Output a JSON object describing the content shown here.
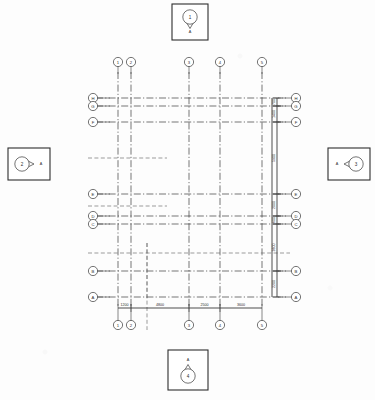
{
  "drawing": {
    "title": "Structural Grid / Column Layout Plan",
    "type": "architectural-grid-plan",
    "line_color": "#3a3a3a",
    "background_color": "#fdfdfd",
    "bubble_fill": "#ffffff"
  },
  "column_grid": {
    "axis_label": "column-grid-lines",
    "lines": [
      {
        "label": "1",
        "x": 118
      },
      {
        "label": "2",
        "x": 131
      },
      {
        "label": "3",
        "x": 189
      },
      {
        "label": "4",
        "x": 220
      },
      {
        "label": "5",
        "x": 262
      }
    ]
  },
  "row_grid": {
    "axis_label": "row-grid-lines",
    "lines": [
      {
        "label": "H",
        "y": 98
      },
      {
        "label": "G",
        "y": 106
      },
      {
        "label": "F",
        "y": 122
      },
      {
        "label": "E",
        "y": 194
      },
      {
        "label": "D",
        "y": 216
      },
      {
        "label": "C",
        "y": 224
      },
      {
        "label": "B",
        "y": 271
      },
      {
        "label": "A",
        "y": 297
      }
    ]
  },
  "dimensions": {
    "horizontal": [
      {
        "value": "1200",
        "from": 118,
        "to": 131
      },
      {
        "value": "4800",
        "from": 131,
        "to": 189
      },
      {
        "value": "2500",
        "from": 189,
        "to": 220
      },
      {
        "value": "3600",
        "from": 220,
        "to": 262
      }
    ],
    "vertical": [
      {
        "value": "700",
        "from": 98,
        "to": 106
      },
      {
        "value": "1400",
        "from": 106,
        "to": 122
      },
      {
        "value": "5900",
        "from": 122,
        "to": 194
      },
      {
        "value": "2000",
        "from": 194,
        "to": 216
      },
      {
        "value": "600",
        "from": 216,
        "to": 224
      },
      {
        "value": "3600",
        "from": 224,
        "to": 271
      },
      {
        "value": "2200",
        "from": 271,
        "to": 297
      }
    ]
  },
  "section_markers": [
    {
      "id": "marker-top",
      "bubble_label": "1",
      "sheet_label": "A",
      "direction": "down",
      "box": {
        "x": 172,
        "y": 4,
        "w": 36,
        "h": 36
      }
    },
    {
      "id": "marker-left",
      "bubble_label": "2",
      "sheet_label": "A",
      "direction": "right",
      "box": {
        "x": 8,
        "y": 148,
        "w": 42,
        "h": 32
      }
    },
    {
      "id": "marker-right",
      "bubble_label": "3",
      "sheet_label": "A",
      "direction": "left",
      "box": {
        "x": 328,
        "y": 148,
        "w": 42,
        "h": 32
      }
    },
    {
      "id": "marker-bottom",
      "bubble_label": "4",
      "sheet_label": "A",
      "direction": "up",
      "box": {
        "x": 168,
        "y": 350,
        "w": 40,
        "h": 40
      }
    }
  ],
  "plan_extents": {
    "left": 110,
    "right": 272,
    "top": 90,
    "bottom": 305
  }
}
